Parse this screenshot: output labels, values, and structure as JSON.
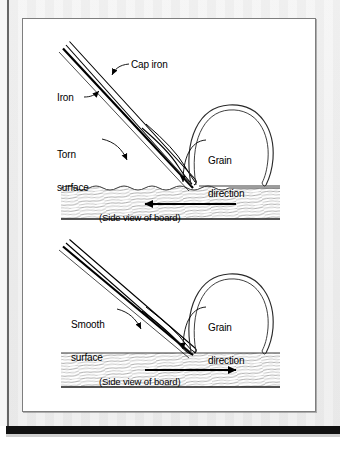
{
  "figure": {
    "caption_top": "(Side view of board)",
    "caption_bottom": "(Side view of board)",
    "colors": {
      "ink": "#000000",
      "board_fill": "#ffffff",
      "grain_line": "#7a7a7a",
      "frame": "#7e7e7e",
      "page": "#eeeeee",
      "bar": "#111111"
    },
    "diagrams": [
      {
        "id": "against-grain",
        "labels": {
          "cap_iron": "Cap iron",
          "iron": "Iron",
          "surface_line1": "Torn",
          "surface_line2": "surface",
          "grain_line1": "Grain",
          "grain_line2": "direction"
        },
        "caption": "(Side view of board)",
        "arrow_direction": "left",
        "surface_state": "torn"
      },
      {
        "id": "with-grain",
        "labels": {
          "surface_line1": "Smooth",
          "surface_line2": "surface",
          "grain_line1": "Grain",
          "grain_line2": "direction"
        },
        "caption": "(Side view of board)",
        "arrow_direction": "right",
        "surface_state": "smooth"
      }
    ]
  }
}
